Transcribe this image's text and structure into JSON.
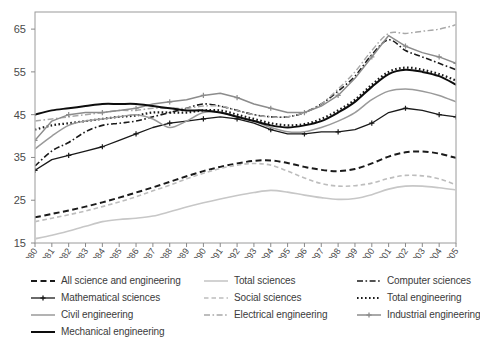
{
  "chart_data": {
    "type": "line",
    "title": "",
    "subtitle": "",
    "xlabel": "",
    "ylabel": "",
    "xlim": [
      1980,
      2005
    ],
    "ylim": [
      15,
      69
    ],
    "yticks": [
      15,
      25,
      35,
      45,
      55,
      65
    ],
    "grid": false,
    "legend_position": "below",
    "x": [
      1980,
      1981,
      1982,
      1983,
      1984,
      1985,
      1986,
      1987,
      1988,
      1989,
      1990,
      1991,
      1992,
      1993,
      1994,
      1995,
      1996,
      1997,
      1998,
      1999,
      2000,
      2001,
      2002,
      2003,
      2004,
      2005
    ],
    "xtick_labels": [
      "1980",
      "1981",
      "1982",
      "1983",
      "1984",
      "1985",
      "1986",
      "1987",
      "1988",
      "1989",
      "1990",
      "1991",
      "1992",
      "1993",
      "1994",
      "1995",
      "1996",
      "1997",
      "1998",
      "1999",
      "2000",
      "2001",
      "2002",
      "2003",
      "2004",
      "2005"
    ],
    "series": [
      {
        "name": "All science and engineering",
        "style": "dashed",
        "color": "#1a1a1a",
        "width": 2.0,
        "marker": "none",
        "values": [
          21.0,
          21.8,
          22.6,
          23.5,
          24.5,
          25.6,
          26.8,
          28.0,
          29.3,
          30.6,
          31.8,
          32.8,
          33.6,
          34.2,
          34.3,
          33.7,
          32.8,
          32.1,
          31.8,
          32.3,
          33.6,
          35.2,
          36.2,
          36.4,
          35.9,
          34.9
        ]
      },
      {
        "name": "Total sciences",
        "style": "solid",
        "color": "#c7c7c7",
        "width": 1.6,
        "marker": "none",
        "values": [
          16.0,
          16.8,
          17.8,
          18.9,
          20.0,
          20.5,
          20.8,
          21.3,
          22.3,
          23.4,
          24.4,
          25.3,
          26.1,
          26.8,
          27.3,
          26.9,
          26.2,
          25.6,
          25.2,
          25.4,
          26.3,
          27.6,
          28.3,
          28.3,
          27.9,
          27.4
        ]
      },
      {
        "name": "Computer sciences",
        "style": "dashdot",
        "color": "#1a1a1a",
        "width": 1.6,
        "marker": "none",
        "values": [
          33.0,
          36.5,
          38.5,
          41.0,
          42.5,
          43.0,
          43.5,
          44.5,
          45.5,
          46.5,
          47.5,
          47.0,
          46.0,
          45.0,
          44.5,
          44.5,
          45.5,
          47.5,
          50.5,
          54.0,
          59.0,
          62.5,
          60.0,
          58.5,
          57.0,
          55.5
        ]
      },
      {
        "name": "Mathematical sciences",
        "style": "solid-plus",
        "color": "#1a1a1a",
        "width": 1.3,
        "marker": "plus",
        "values": [
          32.0,
          34.5,
          35.5,
          36.5,
          37.5,
          39.0,
          40.5,
          42.0,
          43.0,
          43.5,
          44.0,
          44.5,
          44.0,
          43.0,
          41.5,
          40.5,
          40.5,
          41.0,
          41.0,
          41.5,
          43.0,
          45.5,
          46.5,
          46.0,
          45.0,
          44.5
        ]
      },
      {
        "name": "Social sciences",
        "style": "dashed",
        "color": "#bdbdbd",
        "width": 1.6,
        "marker": "none",
        "values": [
          20.0,
          20.8,
          21.6,
          22.5,
          23.5,
          24.6,
          25.8,
          27.2,
          28.5,
          30.0,
          31.3,
          32.4,
          33.2,
          33.6,
          33.2,
          31.8,
          30.2,
          28.9,
          28.3,
          28.4,
          29.0,
          30.1,
          30.8,
          30.7,
          30.0,
          28.6
        ]
      },
      {
        "name": "Total engineering",
        "style": "dotted",
        "color": "#1a1a1a",
        "width": 2.2,
        "marker": "none",
        "values": [
          41.5,
          42.5,
          43.0,
          43.5,
          44.0,
          44.5,
          44.8,
          45.5,
          45.5,
          45.5,
          46.0,
          46.0,
          45.0,
          44.0,
          43.0,
          42.5,
          42.8,
          44.0,
          46.0,
          48.5,
          52.0,
          55.0,
          56.0,
          55.5,
          54.5,
          53.0
        ]
      },
      {
        "name": "Civil engineering",
        "style": "solid",
        "color": "#9a9a9a",
        "width": 1.5,
        "marker": "none",
        "values": [
          37.0,
          40.0,
          42.5,
          43.5,
          44.0,
          44.5,
          45.0,
          44.0,
          42.0,
          43.5,
          45.5,
          45.5,
          44.5,
          43.5,
          42.0,
          41.0,
          41.0,
          42.0,
          43.5,
          45.5,
          48.5,
          50.5,
          51.0,
          50.5,
          49.5,
          48.0
        ]
      },
      {
        "name": "Electrical engineering",
        "style": "dashdot",
        "color": "#a8a8a8",
        "width": 1.5,
        "marker": "none",
        "values": [
          43.5,
          44.0,
          44.5,
          45.0,
          45.5,
          46.0,
          46.0,
          46.5,
          46.5,
          46.5,
          47.0,
          47.0,
          46.0,
          45.0,
          44.5,
          44.5,
          45.5,
          47.5,
          51.0,
          55.0,
          60.0,
          64.0,
          64.0,
          64.5,
          65.0,
          66.0
        ]
      },
      {
        "name": "Industrial engineering",
        "style": "solid-plus",
        "color": "#8c8c8c",
        "width": 1.5,
        "marker": "plus",
        "values": [
          39.0,
          43.5,
          45.0,
          45.5,
          45.5,
          46.0,
          46.5,
          47.5,
          48.0,
          48.5,
          49.5,
          50.0,
          49.0,
          47.5,
          46.5,
          45.5,
          45.5,
          47.0,
          49.5,
          53.5,
          58.5,
          63.5,
          61.0,
          59.5,
          58.5,
          57.0
        ]
      },
      {
        "name": "Mechanical engineering",
        "style": "solid",
        "color": "#0d0d0d",
        "width": 2.0,
        "marker": "none",
        "values": [
          45.0,
          46.0,
          46.5,
          47.0,
          47.5,
          47.5,
          47.5,
          47.0,
          46.5,
          46.0,
          46.0,
          45.5,
          44.5,
          43.5,
          42.5,
          42.0,
          42.5,
          43.5,
          45.5,
          48.0,
          51.5,
          54.5,
          55.5,
          55.0,
          54.0,
          52.0
        ]
      }
    ]
  },
  "legend": {
    "columns": [
      {
        "items": [
          {
            "label": "All science and engineering",
            "series": "All science and engineering"
          },
          {
            "label": "Mathematical sciences",
            "series": "Mathematical sciences"
          },
          {
            "label": "Civil engineering",
            "series": "Civil engineering"
          },
          {
            "label": "Mechanical engineering",
            "series": "Mechanical engineering"
          }
        ]
      },
      {
        "items": [
          {
            "label": "Total sciences",
            "series": "Total sciences"
          },
          {
            "label": "Social sciences",
            "series": "Social sciences"
          },
          {
            "label": "Electrical engineering",
            "series": "Electrical engineering"
          }
        ]
      },
      {
        "items": [
          {
            "label": "Computer sciences",
            "series": "Computer sciences"
          },
          {
            "label": "Total engineering",
            "series": "Total engineering"
          },
          {
            "label": "Industrial engineering",
            "series": "Industrial engineering"
          }
        ]
      }
    ]
  },
  "axes": {
    "frame_color": "#9a9a9a",
    "tick_color": "#8a8a8a",
    "label_color": "#4a4a4a"
  }
}
